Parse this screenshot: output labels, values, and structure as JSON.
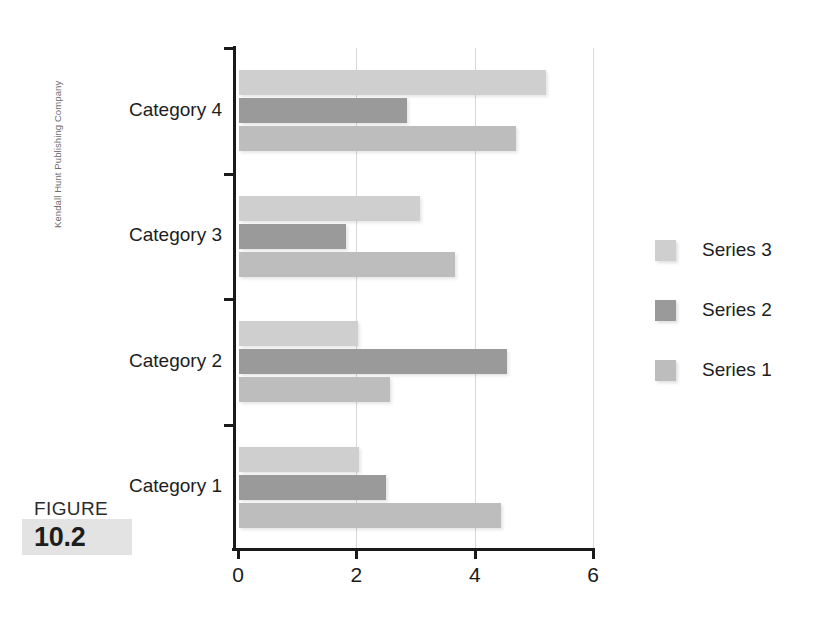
{
  "side_credit": "Kendall Hunt Publishing Company",
  "figure": {
    "word": "FIGURE",
    "number": "10.2"
  },
  "legend": {
    "position": "right",
    "items": [
      {
        "label": "Series 3",
        "color": "#cfcfcf"
      },
      {
        "label": "Series 2",
        "color": "#9a9a9a"
      },
      {
        "label": "Series 1",
        "color": "#bdbdbd"
      }
    ]
  },
  "axis": {
    "x_ticks": [
      "0",
      "2",
      "4",
      "6"
    ],
    "x_tick_values": [
      0,
      2,
      4,
      6
    ],
    "xmin": 0,
    "xmax": 6
  },
  "chart_data": {
    "type": "bar",
    "orientation": "horizontal",
    "title": "",
    "xlabel": "",
    "ylabel": "",
    "xlim": [
      0,
      6
    ],
    "grid": "vertical",
    "legend_position": "right",
    "categories": [
      "Category 1",
      "Category 2",
      "Category 3",
      "Category 4"
    ],
    "series": [
      {
        "name": "Series 1",
        "color": "#bdbdbd",
        "values": [
          4.43,
          2.55,
          3.65,
          4.68
        ]
      },
      {
        "name": "Series 2",
        "color": "#9a9a9a",
        "values": [
          2.48,
          4.53,
          1.81,
          2.84
        ]
      },
      {
        "name": "Series 3",
        "color": "#cfcfcf",
        "values": [
          2.03,
          2.01,
          3.06,
          5.19
        ]
      }
    ]
  },
  "geometry": {
    "x_origin_px": 238,
    "px_per_unit": 59.2,
    "plot_top_px": 48,
    "plot_bottom_px": 550,
    "band_height_px": 125.5,
    "bar_height_px": 25,
    "bar_gap_px": 3
  }
}
